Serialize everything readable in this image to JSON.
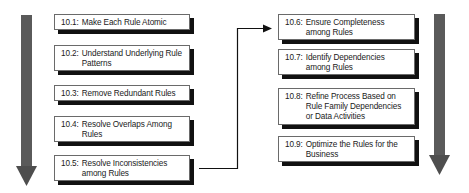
{
  "diagram": {
    "type": "process-flow",
    "left_column": {
      "steps": [
        {
          "number": "10.1:",
          "label": "Make Each Rule Atomic"
        },
        {
          "number": "10.2:",
          "label": "Understand Underlying Rule Patterns"
        },
        {
          "number": "10.3:",
          "label": "Remove Redundant Rules"
        },
        {
          "number": "10.4:",
          "label": "Resolve Overlaps Among Rules"
        },
        {
          "number": "10.5:",
          "label": "Resolve Inconsistencies among Rules"
        }
      ]
    },
    "right_column": {
      "steps": [
        {
          "number": "10.6:",
          "label": "Ensure Completeness among Rules"
        },
        {
          "number": "10.7:",
          "label": "Identify Dependencies among Rules"
        },
        {
          "number": "10.8:",
          "label": "Refine Process Based on Rule Family Dependencies or Data Activities"
        },
        {
          "number": "10.9:",
          "label": "Optimize the Rules for the Business"
        }
      ]
    },
    "connector": {
      "from": "10.5",
      "to": "10.6"
    },
    "colors": {
      "flow_arrow": "#555555",
      "box_border": "#6a6a6a",
      "shadow": "#111111",
      "connector": "#111111"
    }
  }
}
